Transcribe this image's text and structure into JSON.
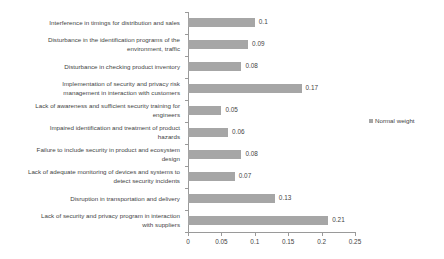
{
  "chart_data": {
    "type": "bar",
    "orientation": "horizontal",
    "title": "",
    "xlabel": "",
    "ylabel": "",
    "xlim": [
      0,
      0.25
    ],
    "xticks": [
      "0",
      "0.05",
      "0.1",
      "0.15",
      "0.2",
      "0.25"
    ],
    "xtick_values": [
      0,
      0.05,
      0.1,
      0.15,
      0.2,
      0.25
    ],
    "grid": false,
    "legend_position": "right",
    "categories": [
      "Interference in timings for distribution and sales",
      "Disturbance in the identification programs of the\nenvironment, traffic",
      "Disturbance in checking product inventory",
      "Implementation of security and privacy risk\nmanagement in interaction with customers",
      "Lack of awareness and sufficient security training for\nengineers",
      "Impaired identification and treatment of product\nhazards",
      "Failure to include security in product and ecosystem\ndesign",
      "Lack of adequate monitoring of devices and systems to\ndetect security incidents",
      "Disruption in transportation and delivery",
      "Lack of security and privacy program in interaction\nwith suppliers"
    ],
    "series": [
      {
        "name": "Normal weight",
        "color": "#a6a6a6",
        "values": [
          0.1,
          0.09,
          0.08,
          0.17,
          0.05,
          0.06,
          0.08,
          0.07,
          0.13,
          0.21
        ],
        "value_labels": [
          "0.1",
          "0.09",
          "0.08",
          "0.17",
          "0.05",
          "0.06",
          "0.08",
          "0.07",
          "0.13",
          "0.21"
        ]
      }
    ]
  },
  "legend": {
    "entries": [
      {
        "label": "Normal weight",
        "color": "#a6a6a6"
      }
    ]
  },
  "colors": {
    "bar": "#a6a6a6",
    "axis": "#9a9a9a",
    "text": "#3f3f3f",
    "background": "#ffffff"
  }
}
